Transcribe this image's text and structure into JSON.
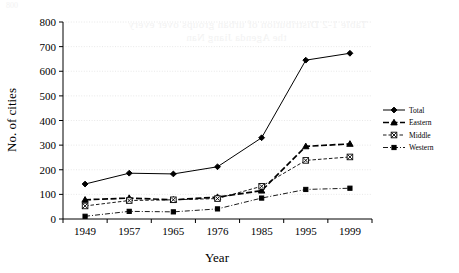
{
  "chart_data": {
    "type": "line",
    "title": "",
    "xlabel": "Year",
    "ylabel": "No. of cities",
    "categories": [
      "1949",
      "1957",
      "1965",
      "1976",
      "1985",
      "1995",
      "1999"
    ],
    "x": [
      1949,
      1957,
      1965,
      1976,
      1985,
      1995,
      1999
    ],
    "series": [
      {
        "name": "Total",
        "values": [
          142,
          186,
          183,
          212,
          330,
          645,
          673
        ],
        "marker": "diamond",
        "linestyle": "solid"
      },
      {
        "name": "Eastern",
        "values": [
          78,
          85,
          78,
          89,
          115,
          295,
          305
        ],
        "marker": "triangle",
        "linestyle": "dashed-bold"
      },
      {
        "name": "Middle",
        "values": [
          53,
          75,
          78,
          83,
          133,
          238,
          252
        ],
        "marker": "x-box",
        "linestyle": "dashed"
      },
      {
        "name": "Western",
        "values": [
          11,
          31,
          29,
          41,
          85,
          120,
          125
        ],
        "marker": "dot",
        "linestyle": "dash-dot"
      }
    ],
    "ylim": [
      0,
      800
    ],
    "yticks": [
      0,
      100,
      200,
      300,
      400,
      500,
      600,
      700,
      800
    ],
    "ytick_labels": [
      "0",
      "100",
      "200",
      "300",
      "400",
      "500",
      "600",
      "700",
      "800"
    ],
    "grid": true,
    "grid_axis": "y",
    "legend_position": "right",
    "legend_entries": [
      "Total",
      "Eastern",
      "Middle",
      "Western"
    ],
    "line_color": "#000000",
    "grid_color": "#d9d9d9"
  },
  "artifacts": {
    "corner_smudge": "800",
    "bleed_line_1": "Table 1-2  Distribution of urban groups over every",
    "bleed_line_2": "the Agenda Jiang Nan"
  }
}
